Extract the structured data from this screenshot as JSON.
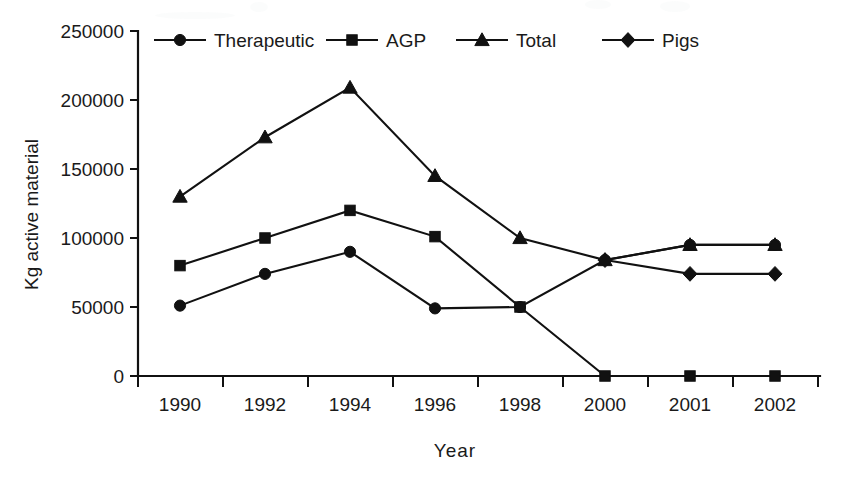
{
  "chart_data": {
    "type": "line",
    "title": "",
    "xlabel": "Year",
    "ylabel": "Kg active material",
    "categories": [
      "1990",
      "1992",
      "1994",
      "1996",
      "1998",
      "2000",
      "2001",
      "2002"
    ],
    "ylim": [
      0,
      250000
    ],
    "ytick_values": [
      0,
      50000,
      100000,
      150000,
      200000,
      250000
    ],
    "ytick_labels": [
      "0",
      "50000",
      "100000",
      "150000",
      "200000",
      "250000"
    ],
    "grid": false,
    "legend_position": "top",
    "series": [
      {
        "name": "Therapeutic",
        "marker": "circle",
        "values": [
          51000,
          74000,
          90000,
          49000,
          50000,
          84000,
          95000,
          95000
        ]
      },
      {
        "name": "AGP",
        "marker": "square",
        "values": [
          80000,
          100000,
          120000,
          101000,
          50000,
          0,
          0,
          0
        ]
      },
      {
        "name": "Total",
        "marker": "triangle",
        "values": [
          130000,
          173000,
          209000,
          145000,
          100000,
          84000,
          95000,
          95000
        ]
      },
      {
        "name": "Pigs",
        "marker": "diamond",
        "values": [
          null,
          null,
          null,
          null,
          null,
          84000,
          74000,
          74000
        ]
      }
    ]
  },
  "axis": {
    "x_title": "Year",
    "y_title": "Kg active material"
  },
  "legend": {
    "items": [
      {
        "label": "Therapeutic",
        "marker": "circle"
      },
      {
        "label": "AGP",
        "marker": "square"
      },
      {
        "label": "Total",
        "marker": "triangle"
      },
      {
        "label": "Pigs",
        "marker": "diamond"
      }
    ]
  },
  "colors": {
    "ink": "#111111",
    "text": "#1a1a1a",
    "background": "#ffffff"
  }
}
